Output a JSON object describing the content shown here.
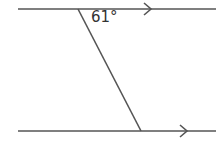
{
  "diagram": {
    "type": "parallel-lines-transversal",
    "angle_label": "61°",
    "line_color": "#555555",
    "top_line": {
      "y": 9,
      "x1": 18,
      "x2": 216,
      "arrow_x": 150
    },
    "bottom_line": {
      "y": 131,
      "x1": 18,
      "x2": 216,
      "arrow_x": 187
    },
    "transversal": {
      "x1": 78,
      "y1": 9,
      "x2": 141,
      "y2": 131
    }
  }
}
